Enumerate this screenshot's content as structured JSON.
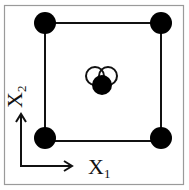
{
  "diagram": {
    "type": "design-of-experiments-factorial",
    "colors": {
      "frame": "#9a9a9a",
      "line": "#111111",
      "point": "#000000",
      "open_point_stroke": "#111111",
      "background": "#ffffff"
    },
    "axes": {
      "x_label": "X",
      "x_subscript": "1",
      "y_label": "X",
      "y_subscript": "2"
    },
    "corner_points": [
      {
        "name": "low-low",
        "x1": -1,
        "x2": -1
      },
      {
        "name": "high-low",
        "x1": 1,
        "x2": -1
      },
      {
        "name": "low-high",
        "x1": -1,
        "x2": 1
      },
      {
        "name": "high-high",
        "x1": 1,
        "x2": 1
      }
    ],
    "center_points": {
      "filled": 1,
      "open": 2
    }
  }
}
